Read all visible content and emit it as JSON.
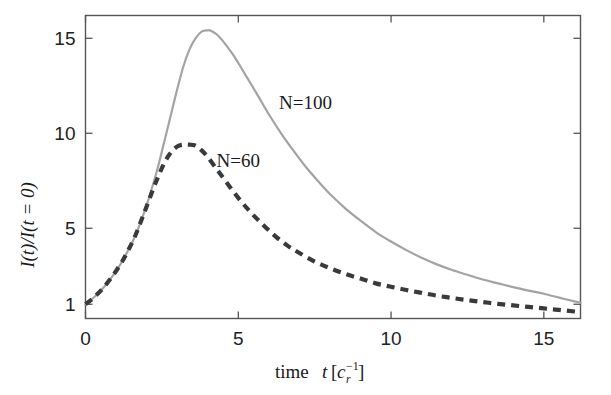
{
  "chart_data": {
    "type": "line",
    "title": "",
    "xlabel": "time t[c_r^-1]",
    "ylabel": "I(t)/I(t = 0)",
    "xlim": [
      0,
      16.2
    ],
    "ylim": [
      0.25,
      16.2
    ],
    "grid": false,
    "legend_position": "inline-annotations",
    "xticks": [
      0,
      5,
      10,
      15
    ],
    "xtick_labels": [
      "0",
      "5",
      "10",
      "15"
    ],
    "yticks": [
      1,
      5,
      10,
      15
    ],
    "ytick_labels": [
      "1",
      "5",
      "10",
      "15"
    ],
    "series": [
      {
        "name": "N=100",
        "style": "solid",
        "color": "#a3a3a3",
        "peak_x": 4.1,
        "peak_y": 15.4,
        "x": [
          0.0,
          0.2,
          0.4,
          0.6,
          0.8,
          1.0,
          1.2,
          1.4,
          1.6,
          1.8,
          2.0,
          2.2,
          2.4,
          2.6,
          2.8,
          3.0,
          3.2,
          3.4,
          3.6,
          3.8,
          4.0,
          4.1,
          4.3,
          4.5,
          4.8,
          5.0,
          5.3,
          5.6,
          6.0,
          6.4,
          6.8,
          7.2,
          7.6,
          8.0,
          8.5,
          9.0,
          9.5,
          10.0,
          10.5,
          11.0,
          11.5,
          12.0,
          12.5,
          13.0,
          13.5,
          14.0,
          14.5,
          15.0,
          15.5,
          16.0,
          16.2
        ],
        "y": [
          1.0,
          1.25,
          1.55,
          1.9,
          2.3,
          2.75,
          3.25,
          3.85,
          4.5,
          5.3,
          6.2,
          7.25,
          8.4,
          9.7,
          11.0,
          12.3,
          13.5,
          14.4,
          15.0,
          15.35,
          15.42,
          15.4,
          15.2,
          14.85,
          14.2,
          13.7,
          12.9,
          12.1,
          11.0,
          10.0,
          9.1,
          8.25,
          7.5,
          6.8,
          6.05,
          5.4,
          4.8,
          4.3,
          3.85,
          3.45,
          3.1,
          2.8,
          2.55,
          2.3,
          2.1,
          1.9,
          1.72,
          1.55,
          1.35,
          1.15,
          1.08
        ]
      },
      {
        "name": "N=60",
        "style": "dashed",
        "color": "#3a3a3a",
        "peak_x": 3.6,
        "peak_y": 9.4,
        "x": [
          0.0,
          0.2,
          0.4,
          0.6,
          0.8,
          1.0,
          1.2,
          1.4,
          1.6,
          1.8,
          2.0,
          2.2,
          2.4,
          2.6,
          2.8,
          3.0,
          3.2,
          3.4,
          3.6,
          3.8,
          4.0,
          4.3,
          4.6,
          5.0,
          5.4,
          5.8,
          6.2,
          6.6,
          7.0,
          7.5,
          8.0,
          8.5,
          9.0,
          9.5,
          10.0,
          10.5,
          11.0,
          11.5,
          12.0,
          12.5,
          13.0,
          13.5,
          14.0,
          14.5,
          15.0,
          15.5,
          16.0,
          16.2
        ],
        "y": [
          1.0,
          1.25,
          1.55,
          1.9,
          2.3,
          2.75,
          3.25,
          3.85,
          4.5,
          5.3,
          6.15,
          7.0,
          7.8,
          8.5,
          9.0,
          9.3,
          9.4,
          9.4,
          9.35,
          9.1,
          8.75,
          8.1,
          7.45,
          6.6,
          5.85,
          5.2,
          4.6,
          4.1,
          3.7,
          3.25,
          2.9,
          2.6,
          2.35,
          2.1,
          1.92,
          1.75,
          1.6,
          1.45,
          1.33,
          1.22,
          1.12,
          1.02,
          0.94,
          0.86,
          0.78,
          0.7,
          0.62,
          0.58
        ]
      }
    ],
    "annotations": [
      {
        "text": "N=100",
        "x": 7.2,
        "y": 11.3
      },
      {
        "text": "N=60",
        "x": 5.0,
        "y": 8.2
      }
    ]
  },
  "axes": {
    "x_title_parts": {
      "word": "time",
      "var": "t",
      "open": "[",
      "base": "c",
      "sub": "r",
      "sup": "−1",
      "close": "]"
    },
    "y_title": "I(t)/I(t = 0)"
  },
  "colors": {
    "series_n100": "#a3a3a3",
    "series_n60": "#3a3a3a",
    "frame": "#555555",
    "text": "#1a1a1a",
    "background": "#ffffff"
  }
}
